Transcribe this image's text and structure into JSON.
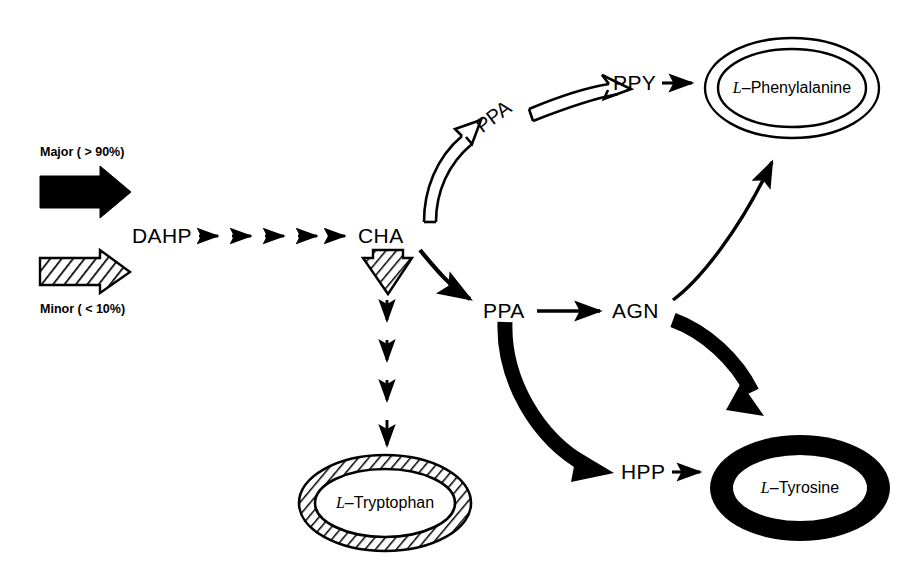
{
  "diagram": {
    "background_color": "#ffffff",
    "stroke_color": "#000000",
    "legend": {
      "major_label": "Major ( > 90%)",
      "major_style": "solid-black-arrow",
      "minor_label": "Minor ( < 10%)",
      "minor_style": "hatched-arrow"
    },
    "nodes": {
      "dahp": "DAHP",
      "cha": "CHA",
      "ppa_upper": "PPA",
      "ppa_lower": "PPA",
      "ppy": "PPY",
      "agn": "AGN",
      "hpp": "HPP"
    },
    "products": {
      "phenylalanine": {
        "prefix": "L",
        "dash": "–",
        "name": "Phenylalanine",
        "ring_style": "double-thin-outline"
      },
      "tyrosine": {
        "prefix": "L",
        "dash": "–",
        "name": "Tyrosine",
        "ring_style": "thick-solid-black"
      },
      "tryptophan": {
        "prefix": "L",
        "dash": "–",
        "name": "Tryptophan",
        "ring_style": "hatched"
      }
    },
    "edges": [
      {
        "from": "DAHP",
        "to": "CHA",
        "style": "multi-step-thin-arrows",
        "steps": 6
      },
      {
        "from": "CHA",
        "to": "L-Tryptophan",
        "style": "hatched-minor-then-dashed-steps",
        "steps": 4
      },
      {
        "from": "CHA",
        "to": "PPA",
        "style": "thin-curve"
      },
      {
        "from": "CHA",
        "to": "PPA (upper)",
        "style": "hollow-outline-curve"
      },
      {
        "from": "PPA (upper)",
        "to": "PPY",
        "style": "hollow-outline-curve"
      },
      {
        "from": "PPY",
        "to": "L-Phenylalanine",
        "style": "thin-arrow"
      },
      {
        "from": "PPA",
        "to": "AGN",
        "style": "thin-arrow"
      },
      {
        "from": "PPA",
        "to": "HPP",
        "style": "thick-black-curve"
      },
      {
        "from": "AGN",
        "to": "L-Phenylalanine",
        "style": "thin-curve"
      },
      {
        "from": "AGN",
        "to": "L-Tyrosine",
        "style": "thick-black-curve"
      },
      {
        "from": "HPP",
        "to": "L-Tyrosine",
        "style": "thin-arrow"
      }
    ]
  }
}
